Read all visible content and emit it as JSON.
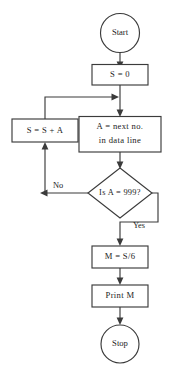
{
  "diagram": {
    "type": "flowchart",
    "colors": {
      "background": "#ffffff",
      "stroke": "#3b3b3b",
      "text": "#1c1c1c",
      "fill": "#ffffff"
    },
    "nodes": [
      {
        "id": "start",
        "shape": "terminator-ellipse",
        "label": "Start",
        "lines": [
          "Start"
        ]
      },
      {
        "id": "init-sum",
        "shape": "process-rectangle",
        "label": "S = 0",
        "lines": [
          "S = 0"
        ]
      },
      {
        "id": "read-next",
        "shape": "process-rectangle",
        "label": "A = next no. in data line",
        "lines": [
          "A = next no.",
          "in data line"
        ]
      },
      {
        "id": "accumulate",
        "shape": "process-rectangle",
        "label": "S = S + A",
        "lines": [
          "S = S + A"
        ]
      },
      {
        "id": "sentinel-test",
        "shape": "decision-diamond",
        "label": "Is A = 999?",
        "lines": [
          "Is A = 999?"
        ]
      },
      {
        "id": "compute-mean",
        "shape": "process-rectangle",
        "label": "M = S/6",
        "lines": [
          "M = S/6"
        ]
      },
      {
        "id": "print-mean",
        "shape": "process-rectangle",
        "label": "Print M",
        "lines": [
          "Print M"
        ]
      },
      {
        "id": "stop",
        "shape": "terminator-ellipse",
        "label": "Stop",
        "lines": [
          "Stop"
        ]
      }
    ],
    "branch_labels": {
      "no": "No",
      "yes": "Yes"
    },
    "edges": [
      {
        "id": "e-start-init",
        "from": "start",
        "to": "init-sum",
        "label": ""
      },
      {
        "id": "e-init-read",
        "from": "init-sum",
        "to": "read-next",
        "label": ""
      },
      {
        "id": "e-read-test",
        "from": "read-next",
        "to": "sentinel-test",
        "label": ""
      },
      {
        "id": "e-test-accumulate",
        "from": "sentinel-test",
        "to": "accumulate",
        "label": "No"
      },
      {
        "id": "e-accumulate-read",
        "from": "accumulate",
        "to": "read-next",
        "label": ""
      },
      {
        "id": "e-test-mean",
        "from": "sentinel-test",
        "to": "compute-mean",
        "label": "Yes"
      },
      {
        "id": "e-mean-print",
        "from": "compute-mean",
        "to": "print-mean",
        "label": ""
      },
      {
        "id": "e-print-stop",
        "from": "print-mean",
        "to": "stop",
        "label": ""
      }
    ]
  }
}
